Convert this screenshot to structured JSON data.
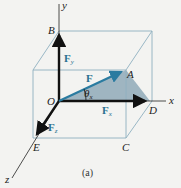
{
  "diagram": {
    "caption": "(a)",
    "axes": {
      "x": "x",
      "y": "y",
      "z": "z"
    },
    "points": {
      "O": "O",
      "A": "A",
      "B": "B",
      "C": "C",
      "D": "D",
      "E": "E"
    },
    "vectors": {
      "F": {
        "label": "F",
        "sub": ""
      },
      "Fx": {
        "label": "F",
        "sub": "x"
      },
      "Fy": {
        "label": "F",
        "sub": "y"
      },
      "Fz": {
        "label": "F",
        "sub": "z"
      }
    },
    "angle": {
      "label": "θ",
      "sub": "x"
    },
    "colors": {
      "box": "#8fb0bf",
      "force": "#2a7ba0",
      "component": "#111111",
      "shade": "#8fa9b8",
      "label_blue": "#2a6f90"
    }
  }
}
